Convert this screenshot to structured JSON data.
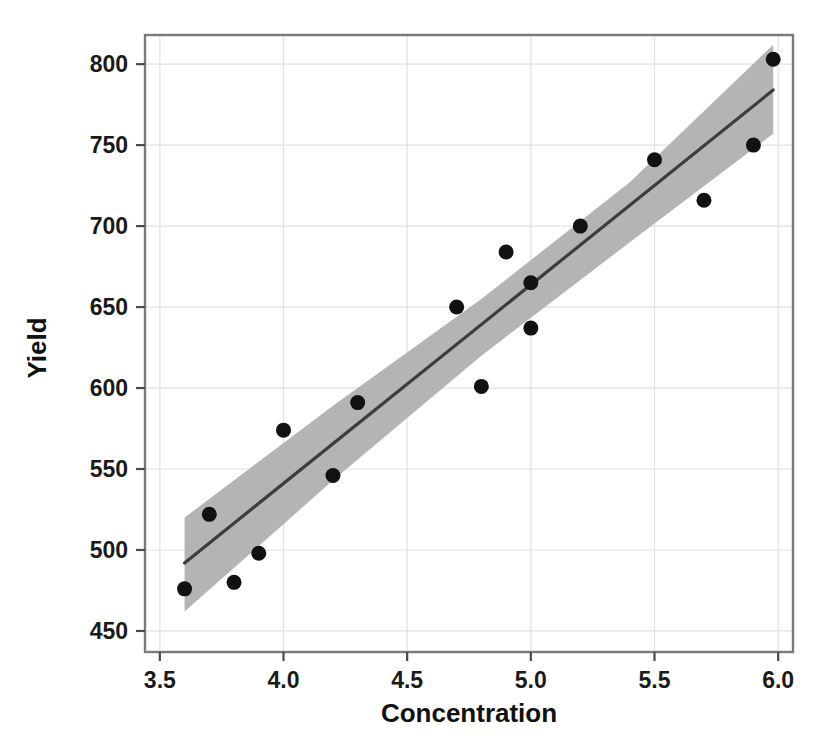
{
  "chart_data": {
    "type": "scatter",
    "title": "",
    "xlabel": "Concentration",
    "ylabel": "Yield",
    "xlim": [
      3.44,
      6.06
    ],
    "ylim": [
      437,
      818
    ],
    "xticks": [
      "3.5",
      "4.0",
      "4.5",
      "5.0",
      "5.5",
      "6.0"
    ],
    "xtick_values": [
      3.5,
      4.0,
      4.5,
      5.0,
      5.5,
      6.0
    ],
    "yticks": [
      "450",
      "500",
      "550",
      "600",
      "650",
      "700",
      "750",
      "800"
    ],
    "ytick_values": [
      450,
      500,
      550,
      600,
      650,
      700,
      750,
      800
    ],
    "grid": true,
    "legend": "none",
    "series": [
      {
        "name": "observations",
        "type": "scatter",
        "marker": "filled-circle",
        "color": "#111111",
        "points": [
          {
            "x": 3.6,
            "y": 476
          },
          {
            "x": 3.7,
            "y": 522
          },
          {
            "x": 3.8,
            "y": 480
          },
          {
            "x": 3.9,
            "y": 498
          },
          {
            "x": 4.0,
            "y": 574
          },
          {
            "x": 4.2,
            "y": 546
          },
          {
            "x": 4.3,
            "y": 591
          },
          {
            "x": 4.7,
            "y": 650
          },
          {
            "x": 4.8,
            "y": 601
          },
          {
            "x": 4.9,
            "y": 684
          },
          {
            "x": 5.0,
            "y": 665
          },
          {
            "x": 5.0,
            "y": 637
          },
          {
            "x": 5.2,
            "y": 700
          },
          {
            "x": 5.5,
            "y": 741
          },
          {
            "x": 5.7,
            "y": 716
          },
          {
            "x": 5.9,
            "y": 750
          },
          {
            "x": 5.98,
            "y": 803
          }
        ]
      },
      {
        "name": "regression-line",
        "type": "line",
        "color": "#3d3d3d",
        "x_start": 3.6,
        "x_end": 5.98,
        "y_start": 492,
        "y_end": 784
      },
      {
        "name": "confidence-band",
        "type": "band",
        "color": "#b4b4b4",
        "x_start": 3.6,
        "x_end": 5.98,
        "lower": [
          {
            "x": 3.6,
            "y": 462
          },
          {
            "x": 4.2,
            "y": 543
          },
          {
            "x": 4.8,
            "y": 620
          },
          {
            "x": 5.4,
            "y": 690
          },
          {
            "x": 5.98,
            "y": 757
          }
        ],
        "upper": [
          {
            "x": 3.6,
            "y": 520
          },
          {
            "x": 4.2,
            "y": 589
          },
          {
            "x": 4.8,
            "y": 655
          },
          {
            "x": 5.4,
            "y": 727
          },
          {
            "x": 5.98,
            "y": 812
          }
        ]
      }
    ]
  },
  "axes": {
    "x_title": "Concentration",
    "y_title": "Yield"
  }
}
